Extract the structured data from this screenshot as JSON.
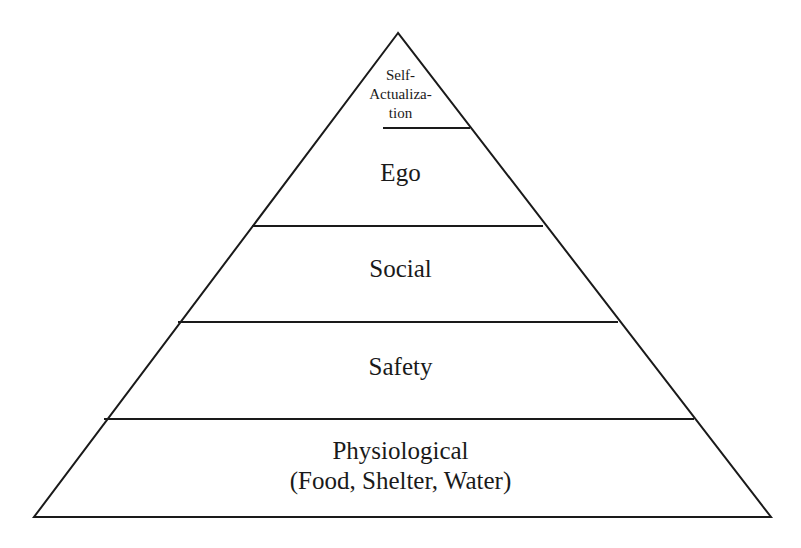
{
  "diagram": {
    "type": "pyramid",
    "levels": [
      {
        "label_lines": [
          "Self-",
          "Actualiza-",
          "tion"
        ]
      },
      {
        "label_lines": [
          "Ego"
        ]
      },
      {
        "label_lines": [
          "Social"
        ]
      },
      {
        "label_lines": [
          "Safety"
        ]
      },
      {
        "label_lines": [
          "Physiological",
          "(Food, Shelter, Water)"
        ]
      }
    ],
    "colors": {
      "stroke": "#1a1a1a",
      "fill": "#ffffff"
    }
  }
}
